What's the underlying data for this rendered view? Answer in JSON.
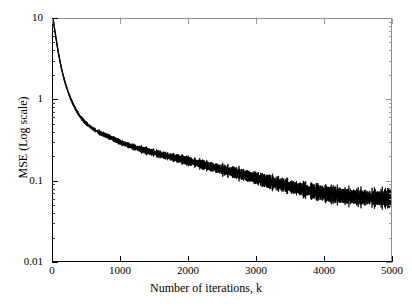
{
  "chart_data": {
    "type": "line",
    "title": "",
    "subtitle": "",
    "xlabel": "Number of iterations, k",
    "ylabel": "MSE (Log scale)",
    "yscale": "log",
    "xscale": "linear",
    "xlim": [
      0,
      5000
    ],
    "ylim": [
      0.01,
      10
    ],
    "grid": false,
    "legend": null,
    "annotations": [],
    "xticks": [
      0,
      1000,
      2000,
      3000,
      4000,
      5000
    ],
    "xticklabels": [
      "0",
      "1000",
      "2000",
      "3000",
      "4000",
      "5000"
    ],
    "yticks": [
      10,
      1,
      0.1,
      0.01
    ],
    "yticklabels": [
      "10",
      "1",
      "0.1",
      "0.01"
    ],
    "series": [
      {
        "name": "MSE",
        "color": "#000000",
        "noise_band": true,
        "x": [
          0,
          25,
          50,
          75,
          100,
          125,
          150,
          175,
          200,
          225,
          250,
          275,
          300,
          350,
          400,
          450,
          500,
          600,
          700,
          800,
          900,
          1000,
          1100,
          1200,
          1300,
          1400,
          1500,
          1600,
          1700,
          1800,
          1900,
          2000,
          2100,
          2200,
          2300,
          2400,
          2500,
          2600,
          2700,
          2800,
          2900,
          3000,
          3100,
          3200,
          3300,
          3400,
          3500,
          3600,
          3700,
          3800,
          3900,
          4000,
          4100,
          4200,
          4300,
          4400,
          4500,
          4600,
          4700,
          4800,
          4900,
          5000
        ],
        "values": [
          10.0,
          7.4,
          5.4,
          4.0,
          3.1,
          2.45,
          2.0,
          1.68,
          1.43,
          1.24,
          1.09,
          0.97,
          0.87,
          0.72,
          0.62,
          0.55,
          0.5,
          0.43,
          0.385,
          0.355,
          0.325,
          0.295,
          0.275,
          0.258,
          0.243,
          0.23,
          0.219,
          0.208,
          0.199,
          0.19,
          0.182,
          0.174,
          0.166,
          0.158,
          0.15,
          0.143,
          0.136,
          0.13,
          0.124,
          0.118,
          0.112,
          0.107,
          0.101,
          0.096,
          0.092,
          0.088,
          0.084,
          0.08,
          0.077,
          0.074,
          0.072,
          0.069,
          0.067,
          0.066,
          0.064,
          0.063,
          0.062,
          0.061,
          0.061,
          0.06,
          0.06,
          0.06
        ]
      }
    ]
  },
  "axes": {
    "x_title": "Number of iterations, k",
    "y_title": "MSE (Log scale)"
  },
  "colors": {
    "curve": "#000000",
    "frame": "#000000",
    "background": "#ffffff"
  }
}
